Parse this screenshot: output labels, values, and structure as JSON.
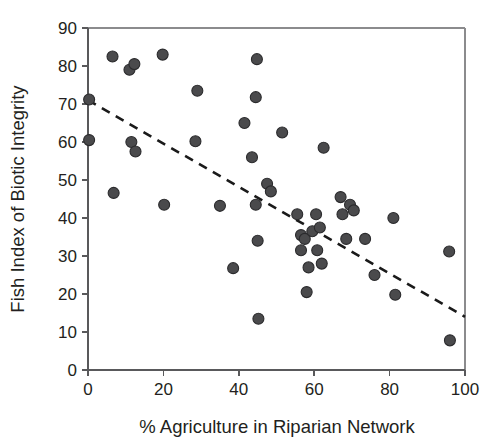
{
  "chart_data": {
    "type": "scatter",
    "title": "",
    "xlabel": "% Agriculture in Riparian Network",
    "ylabel": "Fish Index of Biotic Integrity",
    "xlim": [
      0,
      100
    ],
    "ylim": [
      0,
      90
    ],
    "xticks": [
      0,
      20,
      40,
      60,
      80,
      100
    ],
    "yticks": [
      0,
      10,
      20,
      30,
      40,
      50,
      60,
      70,
      80,
      90
    ],
    "xtick_labels": [
      "0",
      "20",
      "40",
      "60",
      "80",
      "100"
    ],
    "ytick_labels": [
      "0",
      "10",
      "20",
      "30",
      "40",
      "50",
      "60",
      "70",
      "80",
      "90"
    ],
    "grid": false,
    "legend": null,
    "marker": {
      "shape": "circle",
      "fill_color": "#4a4a4c",
      "edge_color": "#2b2b2d",
      "size_px": 11
    },
    "points": [
      {
        "x": 0.3,
        "y": 71.2
      },
      {
        "x": 0.3,
        "y": 60.5
      },
      {
        "x": 6.5,
        "y": 82.5
      },
      {
        "x": 6.8,
        "y": 46.6
      },
      {
        "x": 11.0,
        "y": 79.0
      },
      {
        "x": 12.3,
        "y": 80.5
      },
      {
        "x": 11.5,
        "y": 60.0
      },
      {
        "x": 12.6,
        "y": 57.5
      },
      {
        "x": 19.8,
        "y": 83.0
      },
      {
        "x": 20.2,
        "y": 43.5
      },
      {
        "x": 29.0,
        "y": 73.5
      },
      {
        "x": 28.5,
        "y": 60.2
      },
      {
        "x": 35.0,
        "y": 43.2
      },
      {
        "x": 38.5,
        "y": 26.8
      },
      {
        "x": 41.5,
        "y": 65.0
      },
      {
        "x": 44.8,
        "y": 81.8
      },
      {
        "x": 44.5,
        "y": 71.8
      },
      {
        "x": 43.5,
        "y": 56.0
      },
      {
        "x": 44.5,
        "y": 43.5
      },
      {
        "x": 45.0,
        "y": 34.0
      },
      {
        "x": 45.2,
        "y": 13.5
      },
      {
        "x": 47.5,
        "y": 49.0
      },
      {
        "x": 48.5,
        "y": 47.0
      },
      {
        "x": 51.5,
        "y": 62.5
      },
      {
        "x": 55.5,
        "y": 41.0
      },
      {
        "x": 56.5,
        "y": 35.5
      },
      {
        "x": 56.5,
        "y": 31.5
      },
      {
        "x": 57.5,
        "y": 34.5
      },
      {
        "x": 58.0,
        "y": 20.5
      },
      {
        "x": 58.5,
        "y": 27.0
      },
      {
        "x": 59.5,
        "y": 36.5
      },
      {
        "x": 60.5,
        "y": 41.0
      },
      {
        "x": 60.8,
        "y": 31.5
      },
      {
        "x": 62.5,
        "y": 58.5
      },
      {
        "x": 61.5,
        "y": 37.5
      },
      {
        "x": 62.0,
        "y": 28.0
      },
      {
        "x": 67.0,
        "y": 45.5
      },
      {
        "x": 67.5,
        "y": 41.0
      },
      {
        "x": 69.5,
        "y": 43.5
      },
      {
        "x": 70.5,
        "y": 42.0
      },
      {
        "x": 68.5,
        "y": 34.5
      },
      {
        "x": 73.5,
        "y": 34.5
      },
      {
        "x": 76.0,
        "y": 25.0
      },
      {
        "x": 81.0,
        "y": 40.0
      },
      {
        "x": 81.5,
        "y": 19.8
      },
      {
        "x": 95.8,
        "y": 31.2
      },
      {
        "x": 96.0,
        "y": 7.8
      }
    ],
    "trend_line": {
      "style": "dashed",
      "color": "#1a1a1a",
      "x_start": 0,
      "y_start": 71.0,
      "x_end": 100,
      "y_end": 14.0
    }
  }
}
